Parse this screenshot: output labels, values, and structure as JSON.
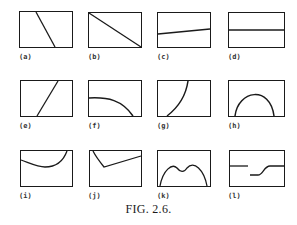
{
  "figure": {
    "caption": "FIG. 2.6.",
    "panels": [
      {
        "label": "(a)",
        "shape": "steep-decreasing-line"
      },
      {
        "label": "(b)",
        "shape": "diagonal-decreasing-line"
      },
      {
        "label": "(c)",
        "shape": "slight-increasing-line"
      },
      {
        "label": "(d)",
        "shape": "horizontal-line"
      },
      {
        "label": "(e)",
        "shape": "steep-increasing-line"
      },
      {
        "label": "(f)",
        "shape": "flat-then-falling-curve"
      },
      {
        "label": "(g)",
        "shape": "rising-concave-curve"
      },
      {
        "label": "(h)",
        "shape": "arch-curve"
      },
      {
        "label": "(i)",
        "shape": "u-shaped-curve"
      },
      {
        "label": "(j)",
        "shape": "v-shaped-line"
      },
      {
        "label": "(k)",
        "shape": "double-hump-curve"
      },
      {
        "label": "(l)",
        "shape": "step-discontinuous-curve"
      }
    ]
  }
}
